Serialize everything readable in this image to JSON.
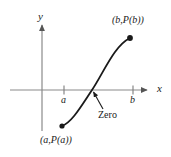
{
  "figure": {
    "kind": "cartesian-graph",
    "colors": {
      "axis": "#888888",
      "curve": "#1a1a1a",
      "text": "#1a1a1a",
      "point": "#1a1a1a",
      "background": "#ffffff"
    },
    "axes": {
      "y_label": "y",
      "x_label": "x",
      "x_axis_y": 90,
      "y_axis_x": 42,
      "x_axis_start": 10,
      "x_axis_end": 152,
      "y_axis_top": 20,
      "y_axis_bottom": 131
    },
    "ticks": [
      {
        "label": "a",
        "x": 64
      },
      {
        "label": "b",
        "x": 133
      }
    ],
    "points": [
      {
        "label": "(a,P(a))",
        "x": 62,
        "y": 126,
        "position": "below-left"
      },
      {
        "label": "(b,P(b))",
        "x": 130,
        "y": 38,
        "position": "above-right"
      }
    ],
    "annotations": [
      {
        "label": "Zero",
        "target_x": 92,
        "target_y": 90,
        "leader_from_x": 102,
        "leader_from_y": 108
      }
    ],
    "curve": {
      "type": "cubic-sigmoid",
      "path": "M 62 126 C 72 122, 80 108, 92 90 C 104 72, 114 46, 130 38"
    }
  }
}
